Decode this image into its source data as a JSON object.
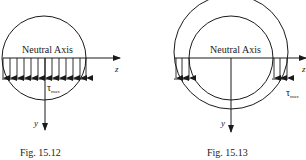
{
  "figures": [
    {
      "id": "fig-15-12",
      "caption": "Fig. 15.12",
      "section": "solid circle",
      "neutral_axis_label": "Neutral Axis",
      "z_label": "z",
      "y_label": "y",
      "tau_label": "τ",
      "tau_sub": "max",
      "arrow_count": 13
    },
    {
      "id": "fig-15-13",
      "caption": "Fig. 15.13",
      "section": "hollow circle (annulus)",
      "neutral_axis_label": "Neutral Axis",
      "z_label": "z",
      "y_label": "y",
      "tau_label": "τ",
      "tau_sub": "max",
      "arrows_per_side": 3
    }
  ],
  "colors": {
    "stroke": "#1a1a1a",
    "background": "#ffffff"
  }
}
